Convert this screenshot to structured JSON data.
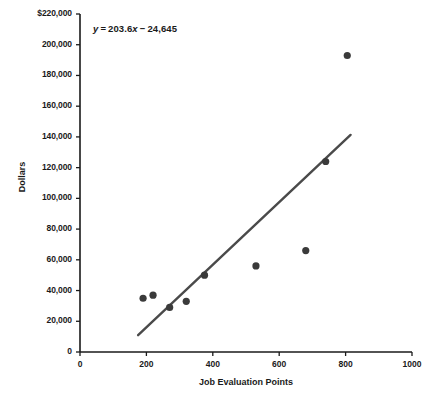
{
  "chart_data": {
    "type": "scatter",
    "title": "",
    "xlabel": "Job Evaluation Points",
    "ylabel": "Dollars",
    "xlim": [
      0,
      1000
    ],
    "ylim": [
      0,
      220000
    ],
    "grid": false,
    "legend": null,
    "xticks": [
      "0",
      "200",
      "400",
      "600",
      "800",
      "1000"
    ],
    "xtick_values": [
      0,
      200,
      400,
      600,
      800,
      1000
    ],
    "yticks": [
      "0",
      "20,000",
      "40,000",
      "60,000",
      "80,000",
      "100,000",
      "120,000",
      "140,000",
      "160,000",
      "180,000",
      "200,000",
      "$220,000"
    ],
    "ytick_values": [
      0,
      20000,
      40000,
      60000,
      80000,
      100000,
      120000,
      140000,
      160000,
      180000,
      200000,
      220000
    ],
    "points": [
      {
        "x": 190,
        "y": 35000
      },
      {
        "x": 220,
        "y": 37000
      },
      {
        "x": 270,
        "y": 29000
      },
      {
        "x": 320,
        "y": 33000
      },
      {
        "x": 375,
        "y": 50000
      },
      {
        "x": 530,
        "y": 56000
      },
      {
        "x": 680,
        "y": 66000
      },
      {
        "x": 740,
        "y": 124000
      },
      {
        "x": 805,
        "y": 193000
      }
    ],
    "trendline": {
      "slope": 203.6,
      "intercept": -24645,
      "x_start": 175,
      "x_end": 815
    },
    "annotation": {
      "y_var": "y",
      "equals": "=",
      "slope_term": "203.6",
      "x_var": "x",
      "minus": "−",
      "intercept_term": "24,645"
    },
    "marker_color": "#3a3a3a",
    "line_color": "#4a4a4a",
    "axis_color": "#1a1a1a"
  }
}
